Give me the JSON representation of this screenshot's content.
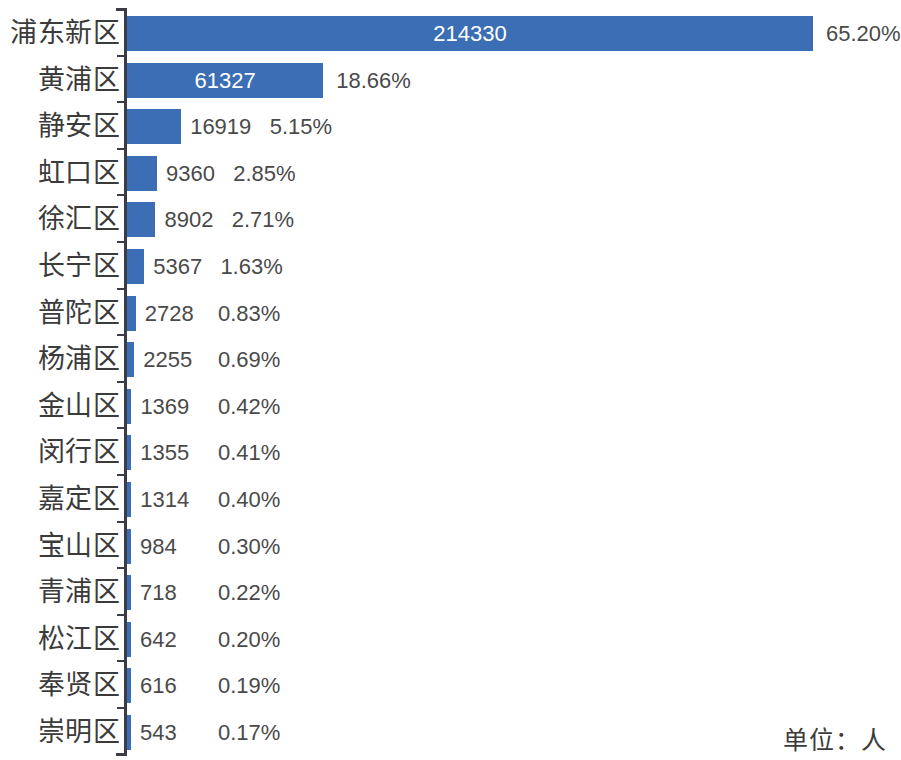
{
  "chart_data": {
    "type": "bar",
    "orientation": "horizontal",
    "title": "",
    "subtitle": "",
    "xlabel": "",
    "ylabel": "",
    "unit_note": "单位：人",
    "grid": false,
    "legend": "none",
    "axis_value_range": [
      0,
      214330
    ],
    "bar_color": "#3b6eb4",
    "label_color": "#3b3b3b",
    "value_color": "#4a4a4a",
    "inside_value_color": "#ffffff",
    "categories": [
      "浦东新区",
      "黄浦区",
      "静安区",
      "虹口区",
      "徐汇区",
      "长宁区",
      "普陀区",
      "杨浦区",
      "金山区",
      "闵行区",
      "嘉定区",
      "宝山区",
      "青浦区",
      "松江区",
      "奉贤区",
      "崇明区"
    ],
    "values": [
      214330,
      61327,
      16919,
      9360,
      8902,
      5367,
      2728,
      2255,
      1369,
      1355,
      1314,
      984,
      718,
      642,
      616,
      543
    ],
    "value_labels": [
      "214330",
      "61327",
      "16919",
      "9360",
      "8902",
      "5367",
      "2728",
      "2255",
      "1369",
      "1355",
      "1314",
      "984",
      "718",
      "642",
      "616",
      "543"
    ],
    "percent_labels": [
      "65.20%",
      "18.66%",
      "5.15%",
      "2.85%",
      "2.71%",
      "1.63%",
      "0.83%",
      "0.69%",
      "0.42%",
      "0.41%",
      "0.40%",
      "0.30%",
      "0.22%",
      "0.20%",
      "0.19%",
      "0.17%"
    ],
    "percent_values": [
      65.2,
      18.66,
      5.15,
      2.85,
      2.71,
      1.63,
      0.83,
      0.69,
      0.42,
      0.41,
      0.4,
      0.3,
      0.22,
      0.2,
      0.19,
      0.17
    ],
    "value_label_inside": [
      true,
      true,
      false,
      false,
      false,
      false,
      false,
      false,
      false,
      false,
      false,
      false,
      false,
      false,
      false,
      false
    ]
  }
}
